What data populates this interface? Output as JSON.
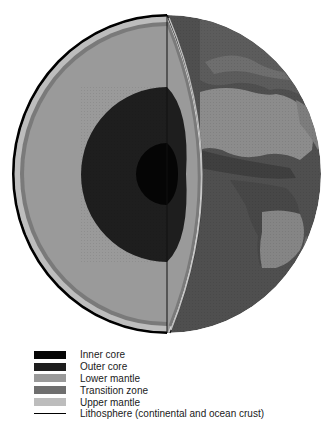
{
  "figure": {
    "layers": [
      {
        "id": "inner_core",
        "label": "Inner core",
        "color": "#050505",
        "swatch_style": "solid"
      },
      {
        "id": "outer_core",
        "label": "Outer core",
        "color": "#1e1e1e",
        "swatch_style": "solid"
      },
      {
        "id": "lower_mantle",
        "label": "Lower mantle",
        "color": "#9a9a9a",
        "swatch_style": "solid"
      },
      {
        "id": "transition_zone",
        "label": "Transition zone",
        "color": "#7a7a7a",
        "swatch_style": "solid"
      },
      {
        "id": "upper_mantle",
        "label": "Upper mantle",
        "color": "#bdbdbd",
        "swatch_style": "solid"
      },
      {
        "id": "lithosphere",
        "label": "Lithosphere (continental and ocean crust)",
        "color": "#000000",
        "swatch_style": "line"
      }
    ],
    "surface_color": "#555555",
    "land_color": "#8a8a8a"
  },
  "legend": {
    "items": [
      "Inner core",
      "Outer core",
      "Lower mantle",
      "Transition zone",
      "Upper mantle",
      "Lithosphere (continental and ocean crust)"
    ]
  }
}
